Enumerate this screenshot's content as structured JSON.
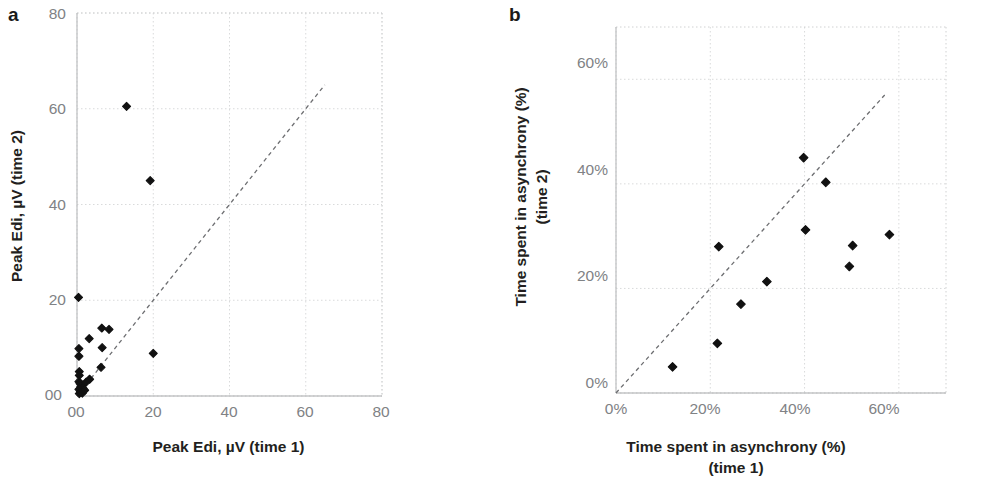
{
  "figure": {
    "panels": [
      {
        "letter": "a",
        "xlabel": "Peak Edi, µV (time 1)",
        "ylabel": "Peak Edi, µV (time 2)",
        "xticks": [
          "00",
          "20",
          "40",
          "60",
          "80"
        ],
        "yticks": [
          "80",
          "60",
          "40",
          "20",
          "00"
        ]
      },
      {
        "letter": "b",
        "xlabel_line1": "Time spent in asynchrony (%)",
        "xlabel_line2": "(time 1)",
        "ylabel_line1": "Time spent in asynchrony (%)",
        "ylabel_line2": "(time 2)",
        "xticks": [
          "0%",
          "20%",
          "40%",
          "60%"
        ],
        "yticks": [
          "60%",
          "40%",
          "20%",
          "0%"
        ]
      }
    ]
  },
  "chart_data": [
    {
      "type": "scatter",
      "panel": "a",
      "title": "",
      "xlabel": "Peak Edi, µV (time 1)",
      "ylabel": "Peak Edi, µV (time 2)",
      "xlim": [
        0,
        80
      ],
      "ylim": [
        0,
        80
      ],
      "xticks": [
        0,
        20,
        40,
        60,
        80
      ],
      "yticks": [
        0,
        20,
        40,
        60,
        80
      ],
      "xtick_labels": [
        "00",
        "20",
        "40",
        "60",
        "80"
      ],
      "ytick_labels": [
        "00",
        "20",
        "40",
        "60",
        "80"
      ],
      "grid": true,
      "legend": false,
      "marker": "diamond",
      "marker_color": "#111111",
      "reference_line": {
        "type": "identity",
        "style": "dashed",
        "color": "#6d6e71",
        "x_start": 0,
        "y_start": 0,
        "x_end": 65,
        "y_end": 65
      },
      "points": [
        [
          0.4,
          20.6
        ],
        [
          13.0,
          60.5
        ],
        [
          19.2,
          45.0
        ],
        [
          6.5,
          14.2
        ],
        [
          3.2,
          12.0
        ],
        [
          8.4,
          13.9
        ],
        [
          6.6,
          10.1
        ],
        [
          0.5,
          9.9
        ],
        [
          0.5,
          8.3
        ],
        [
          6.3,
          6.0
        ],
        [
          0.6,
          5.1
        ],
        [
          0.6,
          4.3
        ],
        [
          3.3,
          3.5
        ],
        [
          20.0,
          8.9
        ],
        [
          0.5,
          3.0
        ],
        [
          0.8,
          2.6
        ],
        [
          1.3,
          2.3
        ],
        [
          1.0,
          1.9
        ],
        [
          1.6,
          1.6
        ],
        [
          0.5,
          1.4
        ],
        [
          2.0,
          1.2
        ],
        [
          0.9,
          0.9
        ],
        [
          1.4,
          0.6
        ],
        [
          0.6,
          0.5
        ],
        [
          2.4,
          2.9
        ]
      ]
    },
    {
      "type": "scatter",
      "panel": "b",
      "title": "",
      "xlabel": "Time spent in asynchrony (%) (time 1)",
      "ylabel": "Time spent in asynchrony (%) (time 2)",
      "xlim": [
        0,
        70
      ],
      "ylim": [
        0,
        70
      ],
      "xticks": [
        0,
        20,
        40,
        60
      ],
      "yticks": [
        0,
        20,
        40,
        60
      ],
      "xtick_labels": [
        "0%",
        "20%",
        "40%",
        "60%"
      ],
      "ytick_labels": [
        "0%",
        "20%",
        "40%",
        "60%"
      ],
      "grid": true,
      "legend": false,
      "marker": "diamond",
      "marker_color": "#111111",
      "reference_line": {
        "type": "identity",
        "style": "dashed",
        "color": "#6d6e71",
        "x_start": 0,
        "y_start": 0,
        "x_end": 57,
        "y_end": 57
      },
      "points": [
        [
          12.0,
          5.0
        ],
        [
          21.5,
          9.5
        ],
        [
          21.8,
          28.0
        ],
        [
          26.5,
          17.0
        ],
        [
          32.0,
          21.3
        ],
        [
          39.8,
          45.0
        ],
        [
          40.2,
          31.2
        ],
        [
          44.5,
          40.3
        ],
        [
          49.5,
          24.2
        ],
        [
          50.2,
          28.2
        ],
        [
          58.0,
          30.3
        ]
      ]
    }
  ]
}
